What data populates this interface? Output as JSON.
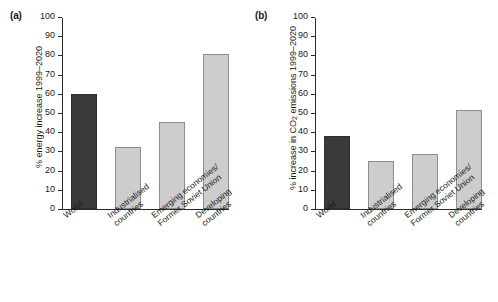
{
  "figure": {
    "panels": [
      {
        "id": "a",
        "label": "(a)",
        "ylabel_main": "% energy increase 1999–2020"
      },
      {
        "id": "b",
        "label": "(b)",
        "ylabel_pre": "% increase in CO",
        "ylabel_sub": "2",
        "ylabel_post": " emissions 1999–2020"
      }
    ]
  },
  "chart_data": [
    {
      "type": "bar",
      "panel": "(a)",
      "title": "",
      "xlabel": "",
      "ylabel": "% energy increase 1999–2020",
      "ylim": [
        0,
        100
      ],
      "yticks": [
        0,
        10,
        20,
        30,
        40,
        50,
        60,
        70,
        80,
        90,
        100
      ],
      "grid": false,
      "legend": "none",
      "categories": [
        "World",
        "Industrialised countries",
        "Emerging economies/ Former Soviet Union",
        "Developing countries"
      ],
      "category_lines": [
        [
          "World"
        ],
        [
          "Industrialised",
          "countries"
        ],
        [
          "Emerging economies/",
          "Former Soviet Union"
        ],
        [
          "Developing",
          "countries"
        ]
      ],
      "values": [
        60,
        32.5,
        45.5,
        80.5
      ],
      "colors": [
        "#3a3a3a",
        "#cdcdcd",
        "#cdcdcd",
        "#cdcdcd"
      ]
    },
    {
      "type": "bar",
      "panel": "(b)",
      "title": "",
      "xlabel": "",
      "ylabel": "% increase in CO2 emissions 1999–2020",
      "ylim": [
        0,
        100
      ],
      "yticks": [
        0,
        10,
        20,
        30,
        40,
        50,
        60,
        70,
        80,
        90,
        100
      ],
      "grid": false,
      "legend": "none",
      "categories": [
        "World",
        "Industrialised countries",
        "Emerging economies/ Former Soviet Union",
        "Developing countries"
      ],
      "category_lines": [
        [
          "World"
        ],
        [
          "Industrialised",
          "countries"
        ],
        [
          "Emerging economies/",
          "Former Soviet Union"
        ],
        [
          "Developing",
          "countries"
        ]
      ],
      "values": [
        38,
        24.8,
        28.6,
        51.5
      ],
      "colors": [
        "#3a3a3a",
        "#cdcdcd",
        "#cdcdcd",
        "#cdcdcd"
      ]
    }
  ]
}
